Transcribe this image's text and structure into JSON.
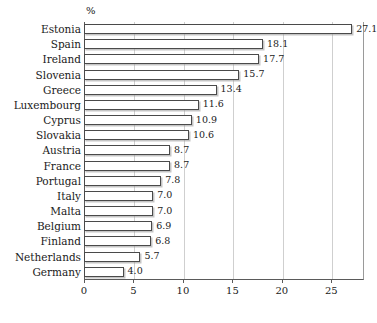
{
  "chart_data": {
    "type": "bar",
    "orientation": "horizontal",
    "title": "",
    "subtitle": "",
    "unit_label": "%",
    "xlabel": "",
    "ylabel": "",
    "xlim": [
      0,
      28.3
    ],
    "xticks": [
      0,
      5,
      10,
      15,
      20,
      25
    ],
    "xticklabels": [
      "0",
      "5",
      "10",
      "15",
      "20",
      "25"
    ],
    "grid": true,
    "grid_axis": "x",
    "legend": false,
    "categories": [
      "Estonia",
      "Spain",
      "Ireland",
      "Slovenia",
      "Greece",
      "Luxembourg",
      "Cyprus",
      "Slovakia",
      "Austria",
      "France",
      "Portugal",
      "Italy",
      "Malta",
      "Belgium",
      "Finland",
      "Netherlands",
      "Germany"
    ],
    "values": [
      27.1,
      18.1,
      17.7,
      15.7,
      13.4,
      11.6,
      10.9,
      10.6,
      8.7,
      8.7,
      7.8,
      7.0,
      7.0,
      6.9,
      6.8,
      5.7,
      4.0
    ],
    "value_labels": [
      "27.1",
      "18.1",
      "17.7",
      "15.7",
      "13.4",
      "11.6",
      "10.9",
      "10.6",
      "8.7",
      "8.7",
      "7.8",
      "7.0",
      "7.0",
      "6.9",
      "6.8",
      "5.7",
      "4.0"
    ],
    "colors": {
      "bar_fill": "#ffffff",
      "bar_border": "#4a4a4a",
      "bar_shadow": "#969696",
      "gridline": "#cfcfcf",
      "axis": "#5a5a5a",
      "text": "#1a1a1a",
      "background": "#ffffff"
    }
  }
}
